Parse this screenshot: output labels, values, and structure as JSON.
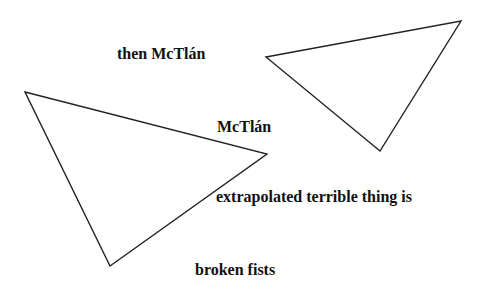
{
  "diagram": {
    "background": "#ffffff",
    "stroke_color": "#222222",
    "shapes": [
      {
        "name": "left-triangle",
        "points": "25,92 267,154 110,266"
      },
      {
        "name": "right-triangle",
        "points": "266,57 461,21 380,151"
      }
    ],
    "labels": [
      {
        "text": "then McTlán",
        "x": 117,
        "y": 46
      },
      {
        "text": "McTlán",
        "x": 217,
        "y": 119
      },
      {
        "text": "extrapolated terrible thing is",
        "x": 216,
        "y": 189
      },
      {
        "text": "broken fists",
        "x": 195,
        "y": 262
      }
    ]
  }
}
